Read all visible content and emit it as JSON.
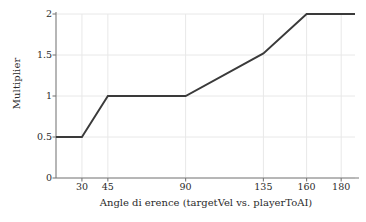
{
  "chart_data": {
    "type": "line",
    "title": "",
    "xlabel": "Angle di erence (targetVel vs. playerToAI)",
    "ylabel": "Multiplier",
    "xlim": [
      15,
      188
    ],
    "ylim": [
      0,
      2
    ],
    "grid": true,
    "legend": null,
    "line_color": "#3a3a3a",
    "grid_color": "#e8e8e8",
    "axis_color": "#7a7a7a",
    "xticks": [
      {
        "value": 30,
        "label": "30"
      },
      {
        "value": 45,
        "label": "45"
      },
      {
        "value": 90,
        "label": "90"
      },
      {
        "value": 135,
        "label": "135"
      },
      {
        "value": 160,
        "label": "160"
      },
      {
        "value": 180,
        "label": "180"
      }
    ],
    "yticks": [
      {
        "value": 0,
        "label": "0"
      },
      {
        "value": 0.5,
        "label": "0.5"
      },
      {
        "value": 1,
        "label": "1"
      },
      {
        "value": 1.5,
        "label": "1.5"
      },
      {
        "value": 2,
        "label": "2"
      }
    ],
    "series": [
      {
        "name": "multiplier",
        "x": [
          15,
          30,
          45,
          90,
          135,
          160,
          188
        ],
        "y": [
          0.5,
          0.5,
          1.0,
          1.0,
          1.52,
          2.0,
          2.0
        ]
      }
    ]
  }
}
